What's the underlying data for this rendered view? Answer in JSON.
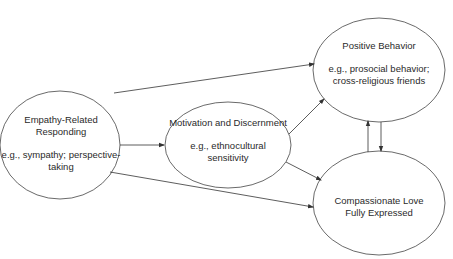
{
  "diagram": {
    "nodes": [
      {
        "id": "empathy",
        "title_lines": [
          "Empathy-Related",
          "Responding"
        ],
        "example_lines": [
          "e.g., sympathy; perspective-",
          "taking"
        ]
      },
      {
        "id": "motivation",
        "title_lines": [
          "Motivation and Discernment"
        ],
        "example_lines": [
          "e.g., ethnocultural",
          "sensitivity"
        ]
      },
      {
        "id": "positive",
        "title_lines": [
          "Positive Behavior"
        ],
        "example_lines": [
          "e.g., prosocial behavior;",
          "cross-religious friends"
        ]
      },
      {
        "id": "compassionate",
        "title_lines": [
          "Compassionate Love",
          "Fully Expressed"
        ],
        "example_lines": []
      }
    ],
    "edges": [
      {
        "from": "empathy",
        "to": "motivation"
      },
      {
        "from": "empathy",
        "to": "positive"
      },
      {
        "from": "empathy",
        "to": "compassionate"
      },
      {
        "from": "motivation",
        "to": "positive"
      },
      {
        "from": "motivation",
        "to": "compassionate"
      },
      {
        "from": "compassionate",
        "to": "positive"
      },
      {
        "from": "positive",
        "to": "compassionate"
      }
    ],
    "colors": {
      "stroke": "#333333",
      "text": "#2a2a2a",
      "background": "#ffffff"
    }
  }
}
